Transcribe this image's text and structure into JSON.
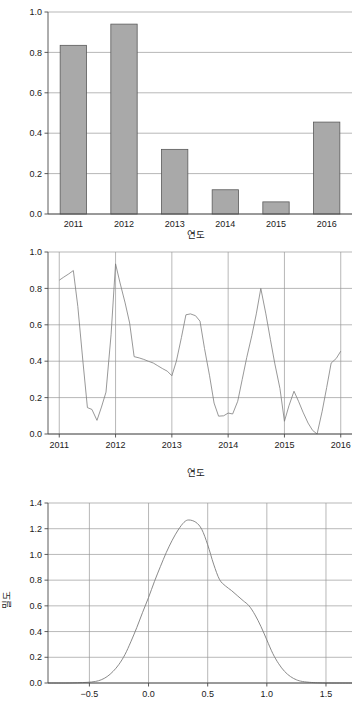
{
  "page": {
    "caption": ""
  },
  "chart_data": [
    {
      "id": "bar-chart",
      "type": "bar",
      "title": "",
      "xlabel": "연도",
      "ylabel": "",
      "categories": [
        "2011",
        "2012",
        "2013",
        "2014",
        "2015",
        "2016"
      ],
      "values": [
        0.835,
        0.94,
        0.32,
        0.12,
        0.06,
        0.455
      ],
      "ylim": [
        0.0,
        1.0
      ],
      "yticks": [
        "0.0",
        "0.2",
        "0.4",
        "0.6",
        "0.8",
        "1.0"
      ],
      "ytick_values": [
        0.0,
        0.2,
        0.4,
        0.6,
        0.8,
        1.0
      ],
      "grid": true,
      "legend": "none",
      "bar_fill": "#a9a9a9",
      "bar_stroke": "#5a5a5a"
    },
    {
      "id": "line-chart",
      "type": "line",
      "title": "",
      "xlabel": "연도",
      "ylabel": "",
      "xlim": [
        2010.8,
        2016.2
      ],
      "ylim": [
        0.0,
        1.0
      ],
      "xticks": [
        "2011",
        "2012",
        "2013",
        "2014",
        "2015",
        "2016"
      ],
      "xtick_values": [
        2011,
        2012,
        2013,
        2014,
        2015,
        2016
      ],
      "yticks": [
        "0.0",
        "0.2",
        "0.4",
        "0.6",
        "0.8",
        "1.0"
      ],
      "ytick_values": [
        0.0,
        0.2,
        0.4,
        0.6,
        0.8,
        1.0
      ],
      "grid": true,
      "legend": "none",
      "line_color": "#7d7d7d",
      "x": [
        2011.0,
        2011.08,
        2011.17,
        2011.25,
        2011.33,
        2011.42,
        2011.5,
        2011.58,
        2011.67,
        2011.75,
        2011.83,
        2011.92,
        2012.0,
        2012.08,
        2012.17,
        2012.25,
        2012.33,
        2012.42,
        2012.5,
        2012.58,
        2012.67,
        2012.75,
        2012.83,
        2012.92,
        2013.0,
        2013.08,
        2013.17,
        2013.25,
        2013.33,
        2013.42,
        2013.5,
        2013.58,
        2013.67,
        2013.75,
        2013.83,
        2013.92,
        2014.0,
        2014.08,
        2014.17,
        2014.25,
        2014.33,
        2014.42,
        2014.5,
        2014.58,
        2014.67,
        2014.75,
        2014.83,
        2014.92,
        2015.0,
        2015.08,
        2015.17,
        2015.25,
        2015.33,
        2015.42,
        2015.5,
        2015.58,
        2015.67,
        2015.75,
        2015.83,
        2015.92,
        2016.0
      ],
      "y": [
        0.845,
        0.862,
        0.88,
        0.898,
        0.7,
        0.4,
        0.145,
        0.135,
        0.075,
        0.148,
        0.23,
        0.545,
        0.935,
        0.83,
        0.72,
        0.61,
        0.425,
        0.418,
        0.41,
        0.4,
        0.39,
        0.375,
        0.36,
        0.345,
        0.32,
        0.4,
        0.53,
        0.655,
        0.66,
        0.65,
        0.62,
        0.47,
        0.32,
        0.17,
        0.098,
        0.1,
        0.115,
        0.11,
        0.18,
        0.3,
        0.42,
        0.54,
        0.66,
        0.8,
        0.66,
        0.52,
        0.385,
        0.25,
        0.07,
        0.155,
        0.235,
        0.18,
        0.12,
        0.06,
        0.02,
        0.0,
        0.125,
        0.255,
        0.39,
        0.415,
        0.455
      ]
    },
    {
      "id": "density-chart",
      "type": "line",
      "title": "",
      "xlabel": "",
      "ylabel": "밀도",
      "xlim": [
        -0.85,
        1.72
      ],
      "ylim": [
        0.0,
        1.4
      ],
      "xticks": [
        "−0.5",
        "0.0",
        "0.5",
        "1.0",
        "1.5"
      ],
      "xtick_values": [
        -0.5,
        0.0,
        0.5,
        1.0,
        1.5
      ],
      "yticks": [
        "0.0",
        "0.2",
        "0.4",
        "0.6",
        "0.8",
        "1.0",
        "1.2",
        "1.4"
      ],
      "ytick_values": [
        0.0,
        0.2,
        0.4,
        0.6,
        0.8,
        1.0,
        1.2,
        1.4
      ],
      "grid": true,
      "legend": "none",
      "line_color": "#7d7d7d",
      "x": [
        -0.85,
        -0.7,
        -0.6,
        -0.52,
        -0.45,
        -0.4,
        -0.35,
        -0.3,
        -0.25,
        -0.2,
        -0.15,
        -0.1,
        -0.05,
        0.0,
        0.05,
        0.1,
        0.15,
        0.2,
        0.25,
        0.3,
        0.34,
        0.4,
        0.45,
        0.5,
        0.55,
        0.6,
        0.65,
        0.7,
        0.75,
        0.8,
        0.85,
        0.9,
        0.95,
        1.0,
        1.05,
        1.1,
        1.15,
        1.2,
        1.25,
        1.3,
        1.38,
        1.45,
        1.55,
        1.72
      ],
      "y": [
        0.0,
        0.0,
        0.002,
        0.005,
        0.012,
        0.025,
        0.05,
        0.09,
        0.145,
        0.22,
        0.32,
        0.43,
        0.55,
        0.665,
        0.79,
        0.905,
        1.015,
        1.11,
        1.19,
        1.25,
        1.268,
        1.25,
        1.195,
        1.075,
        0.925,
        0.805,
        0.755,
        0.72,
        0.68,
        0.64,
        0.6,
        0.53,
        0.44,
        0.335,
        0.23,
        0.15,
        0.09,
        0.05,
        0.025,
        0.012,
        0.004,
        0.001,
        0.0,
        0.0
      ]
    }
  ]
}
